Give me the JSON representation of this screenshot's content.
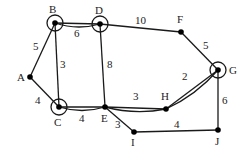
{
  "graph": {
    "nodes": [
      {
        "id": "A",
        "x": 30,
        "y": 77,
        "label": "A",
        "lx": 17,
        "ly": 81,
        "circled": false
      },
      {
        "id": "B",
        "x": 55,
        "y": 23,
        "label": "B",
        "lx": 49,
        "ly": 13,
        "circled": true
      },
      {
        "id": "C",
        "x": 59,
        "y": 107,
        "label": "C",
        "lx": 54,
        "ly": 126,
        "circled": true
      },
      {
        "id": "D",
        "x": 100,
        "y": 24,
        "label": "D",
        "lx": 95,
        "ly": 14,
        "circled": true
      },
      {
        "id": "E",
        "x": 105,
        "y": 107,
        "label": "E",
        "lx": 101,
        "ly": 122,
        "circled": false
      },
      {
        "id": "F",
        "x": 181,
        "y": 32,
        "label": "F",
        "lx": 177,
        "ly": 23,
        "circled": false
      },
      {
        "id": "G",
        "x": 218,
        "y": 70,
        "label": "G",
        "lx": 229,
        "ly": 74,
        "circled": true
      },
      {
        "id": "H",
        "x": 166,
        "y": 109,
        "label": "H",
        "lx": 161,
        "ly": 100,
        "circled": false
      },
      {
        "id": "I",
        "x": 134,
        "y": 132,
        "label": "I",
        "lx": 131,
        "ly": 146,
        "circled": false
      },
      {
        "id": "J",
        "x": 218,
        "y": 130,
        "label": "J",
        "lx": 215,
        "ly": 145,
        "circled": false
      }
    ],
    "edges": [
      {
        "from": "A",
        "to": "B",
        "weight": "5",
        "wx": 33,
        "wy": 50,
        "double": false
      },
      {
        "from": "A",
        "to": "C",
        "weight": "4",
        "wx": 35,
        "wy": 104,
        "double": false
      },
      {
        "from": "B",
        "to": "C",
        "weight": "3",
        "wx": 60,
        "wy": 68,
        "double": false
      },
      {
        "from": "B",
        "to": "D",
        "weight": "6",
        "wx": 74,
        "wy": 37,
        "double": true
      },
      {
        "from": "D",
        "to": "E",
        "weight": "8",
        "wx": 107,
        "wy": 68,
        "double": false
      },
      {
        "from": "D",
        "to": "F",
        "weight": "10",
        "wx": 135,
        "wy": 24,
        "double": false
      },
      {
        "from": "F",
        "to": "G",
        "weight": "5",
        "wx": 203,
        "wy": 49,
        "double": false
      },
      {
        "from": "C",
        "to": "E",
        "weight": "4",
        "wx": 79,
        "wy": 122,
        "double": true
      },
      {
        "from": "E",
        "to": "H",
        "weight": "3",
        "wx": 133,
        "wy": 100,
        "double": true
      },
      {
        "from": "H",
        "to": "G",
        "weight": "2",
        "wx": 182,
        "wy": 80,
        "double": true
      },
      {
        "from": "E",
        "to": "I",
        "weight": "3",
        "wx": 115,
        "wy": 128,
        "double": false
      },
      {
        "from": "I",
        "to": "J",
        "weight": "4",
        "wx": 174,
        "wy": 128,
        "double": false
      },
      {
        "from": "G",
        "to": "J",
        "weight": "6",
        "wx": 222,
        "wy": 104,
        "double": false
      }
    ]
  }
}
